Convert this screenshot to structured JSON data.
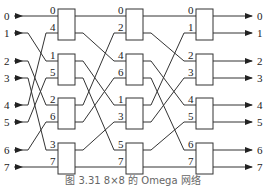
{
  "caption": "图 3.31  8×8 的 Omega 网络",
  "inputs": [
    "0",
    "1",
    "2",
    "3",
    "4",
    "5",
    "6",
    "7"
  ],
  "outputs": [
    "0",
    "1",
    "2",
    "3",
    "4",
    "5",
    "6",
    "7"
  ],
  "stages": [
    {
      "name": "stage-1",
      "switch_inputs": [
        [
          "0",
          "4"
        ],
        [
          "1",
          "5"
        ],
        [
          "2",
          "6"
        ],
        [
          "3",
          "7"
        ]
      ]
    },
    {
      "name": "stage-2",
      "switch_inputs": [
        [
          "0",
          "2"
        ],
        [
          "4",
          "6"
        ],
        [
          "1",
          "3"
        ],
        [
          "5",
          "7"
        ]
      ]
    },
    {
      "name": "stage-3",
      "switch_inputs": [
        [
          "0",
          "1"
        ],
        [
          "2",
          "3"
        ],
        [
          "4",
          "5"
        ],
        [
          "6",
          "7"
        ]
      ]
    }
  ],
  "interconnect": "perfect-shuffle",
  "colors": {
    "line": "#333333",
    "text": "#222222",
    "caption": "#666666"
  }
}
